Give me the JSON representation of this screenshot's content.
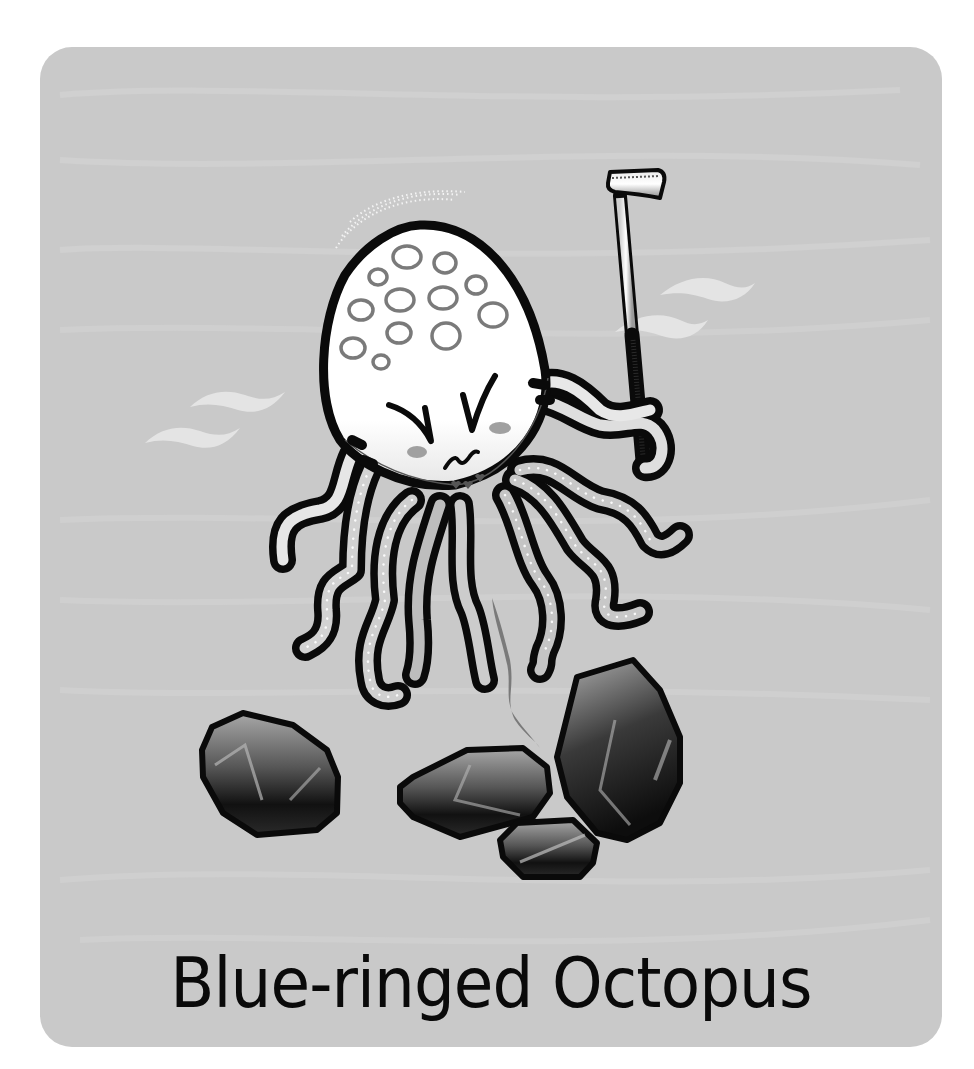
{
  "card": {
    "title": "Blue-ringed Octopus",
    "background_color": "#c9c9c9"
  },
  "illustration": {
    "subject": "octopus",
    "props": [
      "golf-club",
      "rocks",
      "water-waves"
    ],
    "colors": {
      "outline": "#0a0a0a",
      "body": "#ffffff",
      "rings": "#7a7a7a",
      "cheeks": "#a0a0a0",
      "rock_dark": "#1a1a1a",
      "rock_light": "#9a9a9a"
    }
  }
}
